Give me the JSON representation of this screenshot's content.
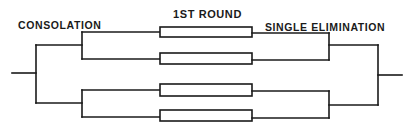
{
  "labels": {
    "consolation": "CONSOLATION",
    "first_round": "1ST ROUND",
    "single_elimination": "SINGLE ELIMINATION"
  },
  "diagram": {
    "type": "tournament-bracket",
    "line_color": "#1a1a1a",
    "box_fill": "#ffffff",
    "first_round_boxes": 4,
    "sections": [
      "CONSOLATION",
      "1ST ROUND",
      "SINGLE ELIMINATION"
    ]
  }
}
